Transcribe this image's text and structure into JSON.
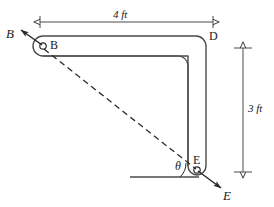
{
  "figure": {
    "background_color": "#ffffff",
    "line_color": "#3a3a3a",
    "text_color": "#1a1a1a"
  },
  "dimensions": [
    {
      "id": "horizontal-span",
      "label": "4 ft",
      "value": 4,
      "unit": "ft",
      "orientation": "horizontal"
    },
    {
      "id": "vertical-span",
      "label": "3 ft",
      "value": 3,
      "unit": "ft",
      "orientation": "vertical"
    }
  ],
  "points": [
    {
      "id": "point-b",
      "label": "B"
    },
    {
      "id": "point-d",
      "label": "D"
    },
    {
      "id": "point-e",
      "label": "E"
    }
  ],
  "forces": [
    {
      "id": "force-b",
      "label": "B",
      "at": "B",
      "direction": "up-left"
    },
    {
      "id": "force-e",
      "label": "E",
      "at": "E",
      "direction": "down-right"
    }
  ],
  "angles": [
    {
      "id": "angle-theta",
      "label": "θ",
      "vertex": "E",
      "between": [
        "horizontal-reference",
        "line-EB"
      ]
    }
  ],
  "lines": [
    {
      "id": "dashed-be",
      "style": "dashed",
      "from": "B",
      "to": "E"
    },
    {
      "id": "horizontal-reference",
      "style": "solid",
      "from": "left",
      "to": "E"
    }
  ]
}
